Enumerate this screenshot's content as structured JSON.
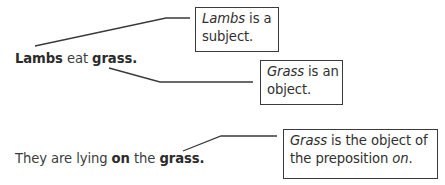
{
  "sentences": [
    {
      "parts": [
        {
          "text": "Lambs",
          "bold": true
        },
        {
          "text": " eat ",
          "bold": false
        },
        {
          "text": "grass.",
          "bold": true
        }
      ]
    },
    {
      "parts": [
        {
          "text": "They are lying ",
          "bold": false
        },
        {
          "text": "on",
          "bold": true
        },
        {
          "text": " the ",
          "bold": false
        },
        {
          "text": "grass.",
          "bold": true
        }
      ]
    }
  ],
  "callouts": [
    {
      "lines": [
        [
          {
            "text": "Lambs",
            "italic": true
          },
          {
            "text": " is a",
            "italic": false
          }
        ],
        [
          {
            "text": "subject.",
            "italic": false
          }
        ]
      ]
    },
    {
      "lines": [
        [
          {
            "text": "Grass",
            "italic": true
          },
          {
            "text": " is an",
            "italic": false
          }
        ],
        [
          {
            "text": "object.",
            "italic": false
          }
        ]
      ]
    },
    {
      "lines": [
        [
          {
            "text": "Grass",
            "italic": true
          },
          {
            "text": " is the object of",
            "italic": false
          }
        ],
        [
          {
            "text": "the preposition ",
            "italic": false
          },
          {
            "text": "on",
            "italic": true
          },
          {
            "text": ".",
            "italic": false
          }
        ]
      ]
    }
  ]
}
